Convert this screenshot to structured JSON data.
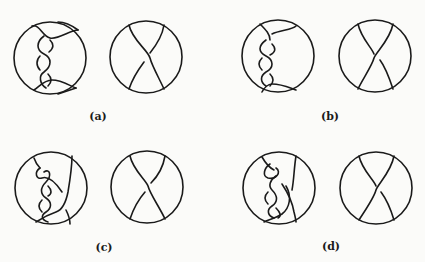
{
  "figure": {
    "panels": [
      {
        "id": "a",
        "label": "(a)",
        "left_tangle": "twisted braid tangle (left strand with two crossings, bridged top and bottom)",
        "right_tangle": "single-crossing X tangle"
      },
      {
        "id": "b",
        "label": "(b)",
        "left_tangle": "twisted braid tangle (mirror variation)",
        "right_tangle": "single-crossing X tangle"
      },
      {
        "id": "c",
        "label": "(c)",
        "left_tangle": "braid with extra loop and diagonal strand",
        "right_tangle": "single-crossing X tangle"
      },
      {
        "id": "d",
        "label": "(d)",
        "left_tangle": "braid with extra loop (mirror variation)",
        "right_tangle": "single-crossing X tangle"
      }
    ],
    "colors": {
      "ink": "#1a1a1a",
      "paper": "#fbfbf9"
    }
  }
}
